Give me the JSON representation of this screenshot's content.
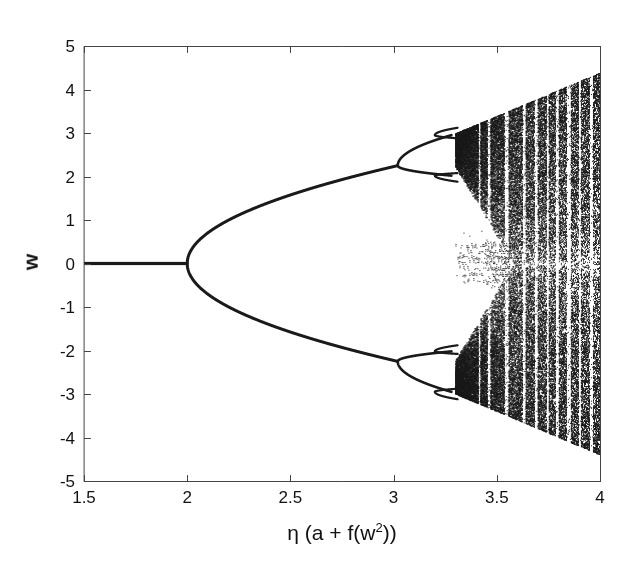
{
  "figure": {
    "background_color": "#ffffff",
    "ink_color": "#1a1a1a",
    "axis_color": "#444444"
  },
  "axes": {
    "x_ticks": [
      "1.5",
      "2",
      "2.5",
      "3",
      "3.5",
      "4"
    ],
    "y_ticks": [
      "5",
      "4",
      "3",
      "2",
      "1",
      "0",
      "-1",
      "-2",
      "-3",
      "-4",
      "-5"
    ],
    "xlabel_prefix": "η (a + f(w",
    "xlabel_exponent": "2",
    "xlabel_suffix": "))",
    "ylabel": "w"
  },
  "chart_data": {
    "type": "scatter",
    "title": "",
    "xlabel": "η (a + f(w²))",
    "ylabel": "w",
    "xlim": [
      1.5,
      4.0
    ],
    "ylim": [
      -5.0,
      5.0
    ],
    "grid": false,
    "legend": null,
    "regions": [
      {
        "name": "fixed-point-branch",
        "x_start": 1.5,
        "x_end": 2.0,
        "w": 0.0
      },
      {
        "name": "pitchfork-bifurcation-point",
        "x": 2.0,
        "w": 0.0
      },
      {
        "name": "upper-branch",
        "x_start": 2.0,
        "x_end": 3.02,
        "w_start": 0.0,
        "w_end": 2.25,
        "shape": "sqrt"
      },
      {
        "name": "lower-branch",
        "x_start": 2.0,
        "x_end": 3.02,
        "w_start": 0.0,
        "w_end": -2.25,
        "shape": "sqrt"
      },
      {
        "name": "period-2-upper",
        "x_start": 3.02,
        "x_end": 3.28,
        "w_lo": 2.02,
        "w_hi": 2.95
      },
      {
        "name": "period-2-lower",
        "x_start": 3.02,
        "x_end": 3.28,
        "w_lo": -2.95,
        "w_hi": -2.02
      },
      {
        "name": "chaotic-band",
        "x_start": 3.3,
        "x_end": 4.0,
        "envelope_start": 3.0,
        "envelope_end": 4.4
      },
      {
        "name": "central-period-band",
        "x_start": 3.3,
        "x_end": 3.56,
        "w_lo": -0.55,
        "w_hi": 0.55
      }
    ],
    "periodic_windows_x": [
      3.415,
      3.46,
      3.545,
      3.63,
      3.69,
      3.745,
      3.79,
      3.845,
      3.9,
      3.955
    ],
    "inner_gap_boundaries": {
      "x_start": 3.3,
      "x_merge": 3.58,
      "w_top_at_start": 2.2,
      "w_bottom_at_start": -2.2
    }
  },
  "plot_box": {
    "left_px": 84,
    "right_px": 600,
    "top_px": 46,
    "bottom_px": 481
  }
}
